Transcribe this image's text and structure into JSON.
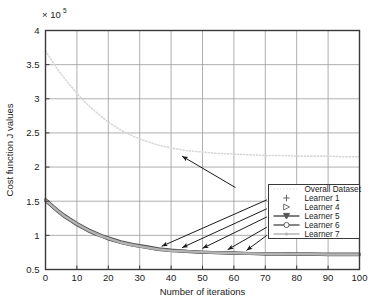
{
  "chart_data": {
    "type": "line",
    "title": "",
    "xlabel": "Number of iterations",
    "ylabel": "Cost function J values",
    "y_exponent_label": "× 10",
    "y_exponent_power": "5",
    "xlim": [
      0,
      100
    ],
    "ylim": [
      0.5,
      4
    ],
    "xticks": [
      0,
      10,
      20,
      30,
      40,
      50,
      60,
      70,
      80,
      90,
      100
    ],
    "xtick_labels": [
      "0",
      "10",
      "20",
      "30",
      "40",
      "50",
      "60",
      "70",
      "80",
      "90",
      "100"
    ],
    "yticks": [
      0.5,
      1,
      1.5,
      2,
      2.5,
      3,
      3.5,
      4
    ],
    "ytick_labels": [
      "0.5",
      "1",
      "1.5",
      "2",
      "2.5",
      "3",
      "3.5",
      "4"
    ],
    "grid": true,
    "legend_position": "lower-right-inside",
    "series": [
      {
        "name": "Overall Dataset",
        "marker": "dotted-line",
        "color": "#d8d8d8",
        "x": [
          0,
          2,
          4,
          6,
          8,
          10,
          12,
          14,
          16,
          18,
          20,
          24,
          28,
          32,
          36,
          40,
          45,
          50,
          55,
          60,
          65,
          70,
          75,
          80,
          85,
          90,
          95,
          100
        ],
        "y": [
          3.7,
          3.56,
          3.42,
          3.3,
          3.19,
          3.08,
          2.98,
          2.89,
          2.81,
          2.73,
          2.66,
          2.54,
          2.45,
          2.38,
          2.32,
          2.28,
          2.24,
          2.22,
          2.2,
          2.19,
          2.18,
          2.17,
          2.17,
          2.16,
          2.16,
          2.16,
          2.15,
          2.15
        ]
      },
      {
        "name": "Learner 1",
        "marker": "plus",
        "color": "#6a6a6a",
        "x": [
          0,
          2,
          4,
          6,
          8,
          10,
          12,
          14,
          16,
          18,
          20,
          24,
          28,
          32,
          36,
          40,
          45,
          50,
          55,
          60,
          65,
          70,
          75,
          80,
          85,
          90,
          95,
          100
        ],
        "y": [
          1.52,
          1.44,
          1.36,
          1.29,
          1.23,
          1.17,
          1.12,
          1.07,
          1.03,
          0.99,
          0.96,
          0.9,
          0.86,
          0.83,
          0.8,
          0.78,
          0.77,
          0.75,
          0.75,
          0.74,
          0.74,
          0.73,
          0.73,
          0.73,
          0.73,
          0.72,
          0.72,
          0.72
        ]
      },
      {
        "name": "Learner 4",
        "marker": "triangle-right",
        "color": "#707070",
        "x": [
          0,
          2,
          4,
          6,
          8,
          10,
          12,
          14,
          16,
          18,
          20,
          24,
          28,
          32,
          36,
          40,
          45,
          50,
          55,
          60,
          65,
          70,
          75,
          80,
          85,
          90,
          95,
          100
        ],
        "y": [
          1.51,
          1.43,
          1.35,
          1.28,
          1.22,
          1.16,
          1.11,
          1.06,
          1.02,
          0.98,
          0.95,
          0.89,
          0.85,
          0.82,
          0.79,
          0.78,
          0.76,
          0.75,
          0.74,
          0.74,
          0.73,
          0.73,
          0.73,
          0.72,
          0.72,
          0.72,
          0.72,
          0.72
        ]
      },
      {
        "name": "Learner 5",
        "marker": "triangle-down-line",
        "color": "#555555",
        "x": [
          0,
          2,
          4,
          6,
          8,
          10,
          12,
          14,
          16,
          18,
          20,
          24,
          28,
          32,
          36,
          40,
          45,
          50,
          55,
          60,
          65,
          70,
          75,
          80,
          85,
          90,
          95,
          100
        ],
        "y": [
          1.53,
          1.45,
          1.37,
          1.3,
          1.24,
          1.18,
          1.13,
          1.08,
          1.04,
          1.0,
          0.97,
          0.91,
          0.87,
          0.84,
          0.81,
          0.79,
          0.77,
          0.76,
          0.75,
          0.75,
          0.74,
          0.74,
          0.74,
          0.73,
          0.73,
          0.73,
          0.73,
          0.73
        ]
      },
      {
        "name": "Learner 6",
        "marker": "circle-line",
        "color": "#5e5e5e",
        "x": [
          0,
          2,
          4,
          6,
          8,
          10,
          12,
          14,
          16,
          18,
          20,
          24,
          28,
          32,
          36,
          40,
          45,
          50,
          55,
          60,
          65,
          70,
          75,
          80,
          85,
          90,
          95,
          100
        ],
        "y": [
          1.5,
          1.42,
          1.34,
          1.27,
          1.21,
          1.15,
          1.1,
          1.05,
          1.01,
          0.98,
          0.94,
          0.89,
          0.85,
          0.82,
          0.79,
          0.77,
          0.76,
          0.75,
          0.74,
          0.73,
          0.73,
          0.72,
          0.72,
          0.72,
          0.72,
          0.71,
          0.71,
          0.71
        ]
      },
      {
        "name": "Learner 7",
        "marker": "dot-line",
        "color": "#b4b4b4",
        "x": [
          0,
          2,
          4,
          6,
          8,
          10,
          12,
          14,
          16,
          18,
          20,
          24,
          28,
          32,
          36,
          40,
          45,
          50,
          55,
          60,
          65,
          70,
          75,
          80,
          85,
          90,
          95,
          100
        ],
        "y": [
          1.515,
          1.435,
          1.355,
          1.285,
          1.225,
          1.165,
          1.115,
          1.065,
          1.025,
          0.985,
          0.955,
          0.895,
          0.855,
          0.825,
          0.795,
          0.775,
          0.765,
          0.755,
          0.745,
          0.74,
          0.735,
          0.73,
          0.73,
          0.725,
          0.725,
          0.72,
          0.72,
          0.72
        ]
      }
    ],
    "annotations": [
      {
        "name": "arrow-to-overall-dataset",
        "from_x": 60.5,
        "from_y": 1.7,
        "to_x": 43.5,
        "to_y": 2.16
      },
      {
        "name": "arrow-to-learner-1",
        "from_x": 70.5,
        "from_y": 1.52,
        "to_x": 37.0,
        "to_y": 0.84
      },
      {
        "name": "arrow-to-learner-4",
        "from_x": 70.5,
        "from_y": 1.39,
        "to_x": 43.5,
        "to_y": 0.82
      },
      {
        "name": "arrow-to-learner-5",
        "from_x": 70.5,
        "from_y": 1.27,
        "to_x": 50.0,
        "to_y": 0.81
      },
      {
        "name": "arrow-to-learner-6",
        "from_x": 70.5,
        "from_y": 1.12,
        "to_x": 58.0,
        "to_y": 0.79
      },
      {
        "name": "arrow-to-learner-7",
        "from_x": 70.5,
        "from_y": 1.0,
        "to_x": 64.0,
        "to_y": 0.78
      }
    ]
  },
  "style": {
    "axis_color": "#3a3a3a",
    "grid_color": "#9a9a9a",
    "background": "#ffffff",
    "legend_border": "#3a3a3a",
    "annotation_color": "#1a1a1a"
  }
}
